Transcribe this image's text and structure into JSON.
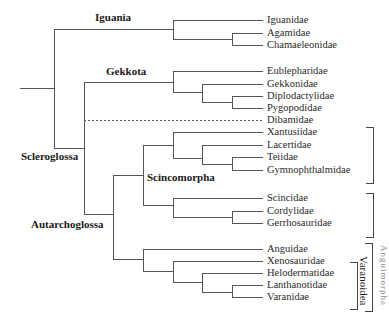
{
  "clades": {
    "iguania": "Iguania",
    "gekkota": "Gekkota",
    "scleroglossa": "Scleroglossa",
    "scincomorpha": "Scincomorpha",
    "autarchoglossa": "Autarchoglossa",
    "varanoidea": "Varanoidea",
    "anguimorpha_cut": "Anguimorpha"
  },
  "leaves": [
    {
      "name": "Iguanidae",
      "y": 20
    },
    {
      "name": "Agamidae",
      "y": 33
    },
    {
      "name": "Chamaeleonidae",
      "y": 45
    },
    {
      "name": "Eublepharidae",
      "y": 71
    },
    {
      "name": "Gekkonidae",
      "y": 84
    },
    {
      "name": "Diplodactylidae",
      "y": 96
    },
    {
      "name": "Pygopodidae",
      "y": 108
    },
    {
      "name": "Dibamidae",
      "y": 120,
      "dashed": true
    },
    {
      "name": "Xantusiidae",
      "y": 132
    },
    {
      "name": "Lacertidae",
      "y": 145
    },
    {
      "name": "Teiidae",
      "y": 157
    },
    {
      "name": "Gymnophthalmidae",
      "y": 170
    },
    {
      "name": "Scincidae",
      "y": 198
    },
    {
      "name": "Cordylidae",
      "y": 211
    },
    {
      "name": "Gerrhosauridae",
      "y": 223
    },
    {
      "name": "Anguidae",
      "y": 249
    },
    {
      "name": "Xenosauridae",
      "y": 261
    },
    {
      "name": "Helodermatidae",
      "y": 273
    },
    {
      "name": "Lanthanotidae",
      "y": 285
    },
    {
      "name": "Varanidae",
      "y": 297
    }
  ]
}
